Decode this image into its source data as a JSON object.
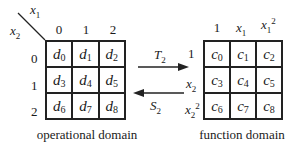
{
  "operational_domain": {
    "caption": "operational domain",
    "corner": {
      "top_var": "x",
      "top_sub": "1",
      "left_var": "x",
      "left_sub": "2"
    },
    "col_headers": [
      "0",
      "1",
      "2"
    ],
    "row_headers": [
      "0",
      "1",
      "2"
    ],
    "cells": [
      {
        "v": "d",
        "s": "0"
      },
      {
        "v": "d",
        "s": "1"
      },
      {
        "v": "d",
        "s": "2"
      },
      {
        "v": "d",
        "s": "3"
      },
      {
        "v": "d",
        "s": "4"
      },
      {
        "v": "d",
        "s": "5"
      },
      {
        "v": "d",
        "s": "6"
      },
      {
        "v": "d",
        "s": "7"
      },
      {
        "v": "d",
        "s": "8"
      }
    ]
  },
  "transforms": {
    "forward": {
      "var": "T",
      "sub": "2"
    },
    "inverse": {
      "var": "S",
      "sub": "2"
    }
  },
  "function_domain": {
    "caption": "function domain",
    "col_headers": [
      {
        "text": "1"
      },
      {
        "var": "x",
        "sub": "1"
      },
      {
        "var": "x",
        "sub": "1",
        "sup": "2"
      }
    ],
    "row_headers": [
      {
        "text": "1"
      },
      {
        "var": "x",
        "sub": "2"
      },
      {
        "var": "x",
        "sub": "2",
        "sup": "2"
      }
    ],
    "cells": [
      {
        "v": "c",
        "s": "0"
      },
      {
        "v": "c",
        "s": "1"
      },
      {
        "v": "c",
        "s": "2"
      },
      {
        "v": "c",
        "s": "3"
      },
      {
        "v": "c",
        "s": "4"
      },
      {
        "v": "c",
        "s": "5"
      },
      {
        "v": "c",
        "s": "6"
      },
      {
        "v": "c",
        "s": "7"
      },
      {
        "v": "c",
        "s": "8"
      }
    ]
  }
}
